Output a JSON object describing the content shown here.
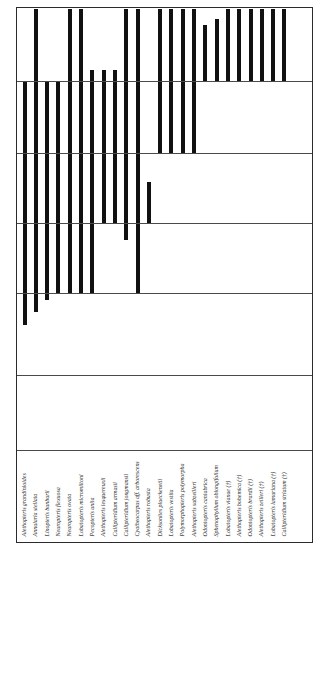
{
  "figure": {
    "kind": "stratigraphic-range-chart",
    "orientation": "vertical-bars",
    "frame_color": "#2b2b2b",
    "bar_color": "#111111",
    "gridline_color": "#4a4a4a"
  },
  "chart_data": {
    "type": "bar",
    "title": "",
    "subtitle": "",
    "xlabel": "",
    "ylabel": "",
    "grid": true,
    "legend": null,
    "axis_note": "Vertical bars are stratigraphic ranges; top of plot = youngest, bottom = oldest. Horizontal lines are biozone / stage boundaries.",
    "ylim": [
      0,
      100
    ],
    "zone_boundaries_pct": [
      13.6,
      27.1,
      40.3,
      53.4,
      68.7,
      82.7
    ],
    "categories": [
      "Alethopteris grandinioides",
      "Annularia stellata",
      "Linopteris bunburii",
      "Neuropteris flexuosa",
      "Neuropteris ovata",
      "Lobatopteris micromiltoni",
      "Pecopteris unita",
      "Alethopteris lesquereuxii",
      "Callipteridium armasii",
      "Callipteridium jongmansii",
      "Cyatheocarpus aff. arborescens",
      "Alethopteris robusta",
      "Lobatopteris vestita",
      "Polymorphopteris polymorpha",
      "Alethopteris subzeilleri",
      "Dicksonites plueckenetii",
      "Lobatopteris vestita",
      "Polymorphopteris polymorpha",
      "Alethopteris subzeilleri",
      "Odontopteris cantabrica",
      "Sphenophyllum oblongifolium",
      "Lobatopteris vianae (†)",
      "Alethopteris bohemica (†)",
      "Odontopteris brardii (†)",
      "Alethopteris zeilleri (†)",
      "Lobatopteris lamuriana (†)",
      "Callipteridium striatum (†)"
    ],
    "labels": [
      "Alethopteris grandinioides",
      "Annularia stellata",
      "Linopteris bunburii",
      "Neuropteris flexuosa",
      "Neuropteris ovata",
      "Lobatopteris micromiltoni",
      "Pecopteris unita",
      "Alethopteris lesquereuxii",
      "Callipteridium armasii",
      "Callipteridium jongmansii",
      "Cyatheocarpus aff. arborescens",
      "Alethopteris robusta",
      "Dicksonites plueckenetii",
      "Lobatopteris vestita",
      "Polymorphopteris polymorpha",
      "Alethopteris subzeilleri",
      "Odontopteris cantabrica",
      "Sphenophyllum oblongifolium",
      "Lobatopteris vianae (†)",
      "Alethopteris bohemica (†)",
      "Odontopteris brardii (†)",
      "Alethopteris zeilleri (†)",
      "Lobatopteris lamuriana (†)",
      "Callipteridium striatum (†)"
    ],
    "ranges": [
      {
        "taxon": "Alethopteris grandinioides",
        "top_pct": 13.6,
        "bottom_pct": 59.4
      },
      {
        "taxon": "Annularia stellata",
        "top_pct": 0.2,
        "bottom_pct": 57.0
      },
      {
        "taxon": "Linopteris bunburii",
        "top_pct": 13.6,
        "bottom_pct": 54.7
      },
      {
        "taxon": "Neuropteris flexuosa",
        "top_pct": 13.6,
        "bottom_pct": 53.4
      },
      {
        "taxon": "Neuropteris ovata",
        "top_pct": 0.2,
        "bottom_pct": 53.4
      },
      {
        "taxon": "Lobatopteris micromiltoni",
        "top_pct": 0.2,
        "bottom_pct": 53.4
      },
      {
        "taxon": "Pecopteris unita",
        "top_pct": 11.6,
        "bottom_pct": 53.4
      },
      {
        "taxon": "Alethopteris lesquereuxii",
        "top_pct": 11.6,
        "bottom_pct": 40.3
      },
      {
        "taxon": "Callipteridium armasii",
        "top_pct": 11.6,
        "bottom_pct": 40.3
      },
      {
        "taxon": "Callipteridium jongmansii",
        "top_pct": 0.2,
        "bottom_pct": 43.5
      },
      {
        "taxon": "Cyatheocarpus aff. arborescens",
        "top_pct": 0.2,
        "bottom_pct": 53.4
      },
      {
        "taxon": "Alethopteris robusta",
        "top_pct": 32.5,
        "bottom_pct": 40.3
      },
      {
        "taxon": "Dicksonites plueckenetii",
        "top_pct": 0.2,
        "bottom_pct": 27.1
      },
      {
        "taxon": "Lobatopteris vestita",
        "top_pct": 0.2,
        "bottom_pct": 27.1
      },
      {
        "taxon": "Polymorphopteris polymorpha",
        "top_pct": 0.2,
        "bottom_pct": 27.1
      },
      {
        "taxon": "Alethopteris subzeilleri",
        "top_pct": 0.2,
        "bottom_pct": 27.1
      },
      {
        "taxon": "Odontopteris cantabrica",
        "top_pct": 3.2,
        "bottom_pct": 13.6
      },
      {
        "taxon": "Sphenophyllum oblongifolium",
        "top_pct": 2.0,
        "bottom_pct": 13.6
      },
      {
        "taxon": "Lobatopteris vianae (†)",
        "top_pct": 0.2,
        "bottom_pct": 13.6
      },
      {
        "taxon": "Alethopteris bohemica (†)",
        "top_pct": 0.2,
        "bottom_pct": 13.6
      },
      {
        "taxon": "Odontopteris brardii (†)",
        "top_pct": 0.2,
        "bottom_pct": 13.6
      },
      {
        "taxon": "Alethopteris zeilleri (†)",
        "top_pct": 0.2,
        "bottom_pct": 13.6
      },
      {
        "taxon": "Lobatopteris lamuriana (†)",
        "top_pct": 0.2,
        "bottom_pct": 13.6
      },
      {
        "taxon": "Callipteridium striatum (†)",
        "top_pct": 0.2,
        "bottom_pct": 13.6
      }
    ]
  }
}
